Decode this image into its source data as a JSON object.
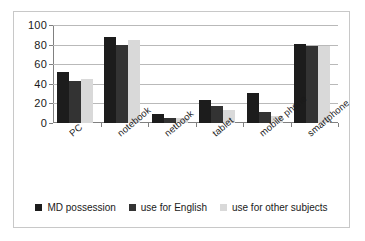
{
  "chart_data": {
    "type": "bar",
    "title": "",
    "subtitle": "",
    "xlabel": "",
    "ylabel": "",
    "ylim": [
      0,
      100
    ],
    "yticks": [
      0,
      20,
      40,
      60,
      80,
      100
    ],
    "ytick_labels": [
      "0",
      "20",
      "40",
      "60",
      "80",
      "100"
    ],
    "grid": true,
    "grid_axis": "y",
    "legend_position": "bottom",
    "categories": [
      "PC",
      "notebook",
      "netbook",
      "tablet",
      "mobile phone",
      "smartphone"
    ],
    "series": [
      {
        "name": "MD possession",
        "color": "#1c1c1c",
        "values": [
          52,
          88,
          9,
          23,
          31,
          81
        ]
      },
      {
        "name": "use for English",
        "color": "#333333",
        "values": [
          43,
          80,
          5,
          17,
          11,
          79
        ]
      },
      {
        "name": "use for other subjects",
        "color": "#d9d9d9",
        "values": [
          45,
          85,
          5,
          13,
          7,
          79
        ]
      }
    ]
  },
  "figure": {
    "border_color": "#c8c8c8",
    "background": "#ffffff",
    "axis_color": "#808080",
    "gridline_color": "#b9b9b9"
  }
}
